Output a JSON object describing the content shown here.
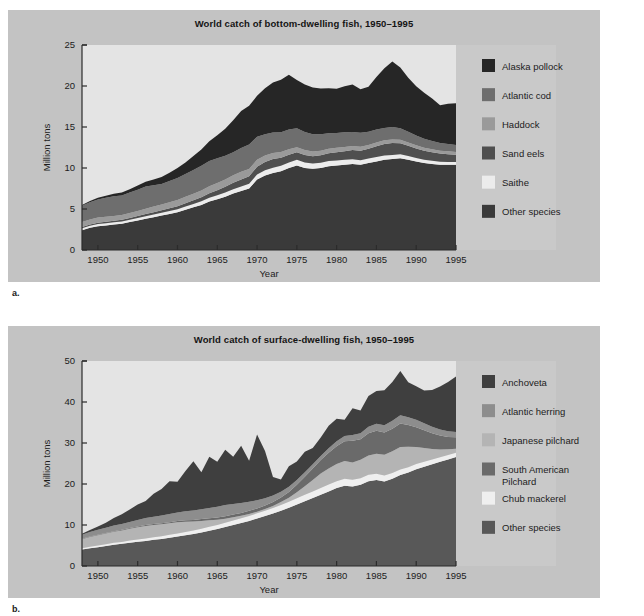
{
  "figures": [
    {
      "panel_label": "a.",
      "title": "World catch of bottom-dwelling fish, 1950–1995",
      "ylabel": "Million tons",
      "xlabel": "Year",
      "legend": [
        {
          "label": "Alaska pollock",
          "color": "#262626"
        },
        {
          "label": "Atlantic cod",
          "color": "#6e6e6e"
        },
        {
          "label": "Haddock",
          "color": "#9a9a9a"
        },
        {
          "label": "Sand eels",
          "color": "#4f4f4f"
        },
        {
          "label": "Saithe",
          "color": "#ececec"
        },
        {
          "label": "Other species",
          "color": "#3a3a3a"
        }
      ]
    },
    {
      "panel_label": "b.",
      "title": "World catch of surface-dwelling fish, 1950–1995",
      "ylabel": "Million tons",
      "xlabel": "Year",
      "legend": [
        {
          "label": "Anchoveta",
          "color": "#3f3f3f"
        },
        {
          "label": "Atlantic herring",
          "color": "#8d8d8d"
        },
        {
          "label": "Japanese pilchard",
          "color": "#b4b4b4"
        },
        {
          "label": "South American\nPilchard",
          "color": "#6a6a6a"
        },
        {
          "label": "Chub mackerel",
          "color": "#efefef"
        },
        {
          "label": "Other species",
          "color": "#585858"
        }
      ]
    }
  ],
  "chart_data": [
    {
      "type": "area",
      "stacked": true,
      "title": "World catch of bottom-dwelling fish, 1950–1995",
      "xlabel": "Year",
      "ylabel": "Million tons",
      "xlim": [
        1948,
        1995
      ],
      "ylim": [
        0,
        25
      ],
      "yticks": [
        0,
        5,
        10,
        15,
        20,
        25
      ],
      "xticks": [
        1950,
        1955,
        1960,
        1965,
        1970,
        1975,
        1980,
        1985,
        1990,
        1995
      ],
      "grid": false,
      "legend_position": "right",
      "x": [
        1948,
        1949,
        1950,
        1951,
        1952,
        1953,
        1954,
        1955,
        1956,
        1957,
        1958,
        1959,
        1960,
        1961,
        1962,
        1963,
        1964,
        1965,
        1966,
        1967,
        1968,
        1969,
        1970,
        1971,
        1972,
        1973,
        1974,
        1975,
        1976,
        1977,
        1978,
        1979,
        1980,
        1981,
        1982,
        1983,
        1984,
        1985,
        1986,
        1987,
        1988,
        1989,
        1990,
        1991,
        1992,
        1993,
        1994,
        1995
      ],
      "series": [
        {
          "name": "Other species",
          "color": "#3a3a3a",
          "values": [
            2.4,
            2.7,
            2.9,
            3.0,
            3.1,
            3.2,
            3.4,
            3.6,
            3.8,
            4.0,
            4.2,
            4.4,
            4.6,
            4.9,
            5.2,
            5.5,
            5.9,
            6.2,
            6.5,
            6.9,
            7.2,
            7.5,
            8.6,
            9.1,
            9.4,
            9.6,
            10.0,
            10.3,
            10.0,
            9.9,
            10.0,
            10.2,
            10.3,
            10.4,
            10.5,
            10.4,
            10.6,
            10.8,
            11.0,
            11.1,
            11.2,
            11.0,
            10.8,
            10.6,
            10.5,
            10.4,
            10.4,
            10.4
          ]
        },
        {
          "name": "Saithe",
          "color": "#ececec",
          "values": [
            0.25,
            0.25,
            0.26,
            0.26,
            0.27,
            0.28,
            0.29,
            0.3,
            0.32,
            0.33,
            0.35,
            0.36,
            0.38,
            0.4,
            0.42,
            0.44,
            0.46,
            0.48,
            0.5,
            0.52,
            0.55,
            0.58,
            0.6,
            0.62,
            0.64,
            0.66,
            0.68,
            0.7,
            0.68,
            0.66,
            0.65,
            0.64,
            0.62,
            0.6,
            0.58,
            0.56,
            0.55,
            0.54,
            0.52,
            0.5,
            0.48,
            0.45,
            0.42,
            0.4,
            0.38,
            0.36,
            0.34,
            0.32
          ]
        },
        {
          "name": "Sand eels",
          "color": "#4f4f4f",
          "values": [
            0.15,
            0.16,
            0.17,
            0.18,
            0.19,
            0.2,
            0.22,
            0.24,
            0.26,
            0.28,
            0.3,
            0.33,
            0.36,
            0.4,
            0.45,
            0.5,
            0.55,
            0.62,
            0.7,
            0.78,
            0.85,
            0.9,
            0.95,
            1.0,
            1.05,
            1.0,
            0.95,
            0.92,
            0.9,
            0.88,
            0.9,
            0.95,
            1.0,
            1.05,
            1.1,
            1.15,
            1.2,
            1.3,
            1.4,
            1.45,
            1.35,
            1.25,
            1.15,
            1.1,
            1.05,
            1.0,
            0.95,
            0.9
          ]
        },
        {
          "name": "Haddock",
          "color": "#9a9a9a",
          "values": [
            0.6,
            0.62,
            0.64,
            0.62,
            0.6,
            0.58,
            0.6,
            0.62,
            0.65,
            0.68,
            0.7,
            0.72,
            0.75,
            0.78,
            0.8,
            0.82,
            0.85,
            0.88,
            0.9,
            0.92,
            0.95,
            0.9,
            0.85,
            0.8,
            0.75,
            0.7,
            0.65,
            0.62,
            0.6,
            0.58,
            0.56,
            0.55,
            0.54,
            0.52,
            0.5,
            0.48,
            0.47,
            0.46,
            0.45,
            0.44,
            0.43,
            0.42,
            0.4,
            0.38,
            0.36,
            0.35,
            0.34,
            0.33
          ]
        },
        {
          "name": "Atlantic cod",
          "color": "#6e6e6e",
          "values": [
            2.0,
            2.1,
            2.2,
            2.3,
            2.4,
            2.4,
            2.5,
            2.6,
            2.7,
            2.6,
            2.5,
            2.6,
            2.7,
            2.8,
            2.9,
            3.0,
            3.1,
            3.0,
            2.9,
            2.8,
            2.9,
            3.0,
            2.8,
            2.6,
            2.5,
            2.4,
            2.4,
            2.3,
            2.2,
            2.1,
            2.0,
            1.9,
            1.8,
            1.8,
            1.7,
            1.7,
            1.6,
            1.6,
            1.5,
            1.5,
            1.4,
            1.3,
            1.2,
            1.1,
            1.0,
            0.95,
            0.9,
            0.85
          ]
        },
        {
          "name": "Alaska pollock",
          "color": "#262626",
          "values": [
            0.1,
            0.15,
            0.2,
            0.25,
            0.3,
            0.35,
            0.4,
            0.5,
            0.6,
            0.7,
            0.85,
            1.0,
            1.2,
            1.4,
            1.7,
            2.0,
            2.4,
            2.8,
            3.3,
            3.9,
            4.5,
            4.7,
            5.0,
            5.6,
            6.1,
            6.4,
            6.7,
            5.9,
            5.8,
            5.7,
            5.6,
            5.5,
            5.4,
            5.6,
            5.8,
            5.3,
            5.5,
            6.4,
            7.3,
            8.0,
            7.4,
            6.6,
            6.0,
            5.6,
            5.2,
            4.6,
            4.9,
            5.1
          ]
        }
      ]
    },
    {
      "type": "area",
      "stacked": true,
      "title": "World catch of surface-dwelling fish, 1950–1995",
      "xlabel": "Year",
      "ylabel": "Million tons",
      "xlim": [
        1948,
        1995
      ],
      "ylim": [
        0,
        50
      ],
      "yticks": [
        0,
        10,
        20,
        30,
        40,
        50
      ],
      "xticks": [
        1950,
        1955,
        1960,
        1965,
        1970,
        1975,
        1980,
        1985,
        1990,
        1995
      ],
      "grid": false,
      "legend_position": "right",
      "x": [
        1948,
        1949,
        1950,
        1951,
        1952,
        1953,
        1954,
        1955,
        1956,
        1957,
        1958,
        1959,
        1960,
        1961,
        1962,
        1963,
        1964,
        1965,
        1966,
        1967,
        1968,
        1969,
        1970,
        1971,
        1972,
        1973,
        1974,
        1975,
        1976,
        1977,
        1978,
        1979,
        1980,
        1981,
        1982,
        1983,
        1984,
        1985,
        1986,
        1987,
        1988,
        1989,
        1990,
        1991,
        1992,
        1993,
        1994,
        1995
      ],
      "series": [
        {
          "name": "Other species",
          "color": "#585858",
          "values": [
            4.0,
            4.3,
            4.6,
            4.9,
            5.2,
            5.4,
            5.7,
            5.9,
            6.1,
            6.4,
            6.6,
            6.9,
            7.2,
            7.5,
            7.8,
            8.2,
            8.6,
            9.0,
            9.5,
            10.0,
            10.5,
            11.0,
            11.6,
            12.2,
            12.8,
            13.5,
            14.2,
            15.0,
            15.8,
            16.6,
            17.4,
            18.2,
            19.0,
            19.6,
            19.4,
            19.8,
            20.7,
            21.0,
            20.6,
            21.3,
            22.2,
            22.8,
            23.6,
            24.2,
            24.8,
            25.4,
            26.0,
            26.6
          ]
        },
        {
          "name": "Chub mackerel",
          "color": "#efefef",
          "values": [
            0.35,
            0.38,
            0.4,
            0.42,
            0.45,
            0.48,
            0.5,
            0.55,
            0.58,
            0.62,
            0.66,
            0.7,
            0.75,
            0.8,
            0.85,
            0.9,
            0.95,
            1.0,
            1.05,
            1.1,
            1.15,
            1.2,
            1.25,
            1.3,
            1.35,
            1.4,
            1.45,
            1.5,
            1.55,
            1.6,
            1.65,
            1.7,
            1.7,
            1.7,
            1.65,
            1.6,
            1.55,
            1.5,
            1.45,
            1.4,
            1.35,
            1.3,
            1.25,
            1.2,
            1.15,
            1.1,
            1.05,
            1.0
          ]
        },
        {
          "name": "Japanese pilchard",
          "color": "#b4b4b4",
          "values": [
            2.2,
            2.4,
            2.5,
            2.6,
            2.7,
            2.8,
            2.9,
            3.0,
            3.1,
            3.0,
            2.9,
            2.8,
            2.7,
            2.5,
            2.2,
            1.9,
            1.6,
            1.3,
            1.0,
            0.8,
            0.6,
            0.5,
            0.4,
            0.4,
            0.5,
            0.7,
            1.0,
            1.5,
            2.1,
            2.8,
            3.5,
            3.9,
            4.2,
            4.3,
            4.2,
            4.5,
            4.7,
            4.9,
            5.1,
            5.3,
            5.5,
            5.0,
            4.2,
            3.4,
            2.6,
            1.9,
            1.4,
            1.0
          ]
        },
        {
          "name": "South American Pilchard",
          "color": "#6a6a6a",
          "values": [
            0.1,
            0.1,
            0.12,
            0.13,
            0.14,
            0.15,
            0.16,
            0.18,
            0.2,
            0.22,
            0.25,
            0.28,
            0.32,
            0.36,
            0.4,
            0.45,
            0.5,
            0.55,
            0.6,
            0.65,
            0.7,
            0.75,
            0.8,
            0.85,
            0.95,
            1.1,
            1.4,
            1.8,
            2.3,
            2.8,
            3.3,
            3.8,
            4.3,
            4.8,
            5.3,
            5.0,
            5.4,
            5.6,
            5.4,
            5.5,
            5.7,
            5.3,
            4.8,
            4.3,
            3.8,
            3.4,
            3.0,
            2.8
          ]
        },
        {
          "name": "Atlantic herring",
          "color": "#8d8d8d",
          "values": [
            1.0,
            1.1,
            1.2,
            1.3,
            1.4,
            1.4,
            1.5,
            1.6,
            1.7,
            1.8,
            1.9,
            2.0,
            2.1,
            2.2,
            2.3,
            2.4,
            2.5,
            2.6,
            2.7,
            2.6,
            2.4,
            2.2,
            2.0,
            1.8,
            1.6,
            1.4,
            1.3,
            1.2,
            1.1,
            1.0,
            1.0,
            1.1,
            1.2,
            1.3,
            1.4,
            1.5,
            1.6,
            1.7,
            1.8,
            1.9,
            2.0,
            1.9,
            1.8,
            1.7,
            1.6,
            1.5,
            1.4,
            1.3
          ]
        },
        {
          "name": "Anchoveta",
          "color": "#3f3f3f",
          "values": [
            0.2,
            0.5,
            0.8,
            1.2,
            1.8,
            2.4,
            3.0,
            3.8,
            4.2,
            5.6,
            6.5,
            8.0,
            7.5,
            9.8,
            12.0,
            9.0,
            12.5,
            11.0,
            13.5,
            11.5,
            14.0,
            10.0,
            16.0,
            11.5,
            4.5,
            3.0,
            5.0,
            4.5,
            5.0,
            4.0,
            4.5,
            5.5,
            5.5,
            4.0,
            6.5,
            5.5,
            7.5,
            8.0,
            8.5,
            9.5,
            10.8,
            8.5,
            8.2,
            8.0,
            9.0,
            10.5,
            12.0,
            13.5
          ]
        }
      ]
    }
  ]
}
